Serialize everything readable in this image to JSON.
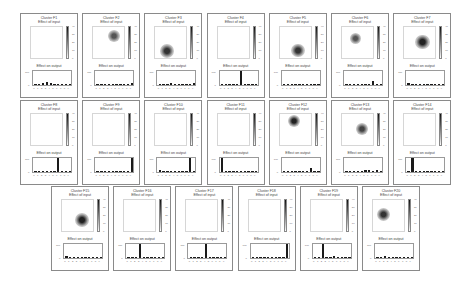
{
  "figure": {
    "panel_subtitle": "Effect of input",
    "output_title": "Effect on output",
    "colorbar_ticks": [
      "40",
      "30",
      "20",
      "10",
      "0"
    ],
    "bar_yticks": [
      "100",
      "0"
    ],
    "bar_xticks": [
      "0",
      "1",
      "2",
      "3",
      "4",
      "5",
      "6",
      "7",
      "8",
      "9"
    ]
  },
  "chart_data": {
    "type": "heatmap+bar",
    "ylim_bars": [
      0,
      100
    ],
    "panels": [
      {
        "title": "Cluster F1",
        "blob": null,
        "values": [
          10,
          10,
          12,
          20,
          12,
          2,
          0,
          0,
          0,
          0
        ]
      },
      {
        "title": "Cluster F2",
        "blob": {
          "x": 0.62,
          "y": 0.28,
          "r": 0.18,
          "c": "#555"
        },
        "values": [
          5,
          0,
          0,
          0,
          5,
          0,
          0,
          5,
          8,
          12
        ]
      },
      {
        "title": "Cluster F3",
        "blob": {
          "x": 0.35,
          "y": 0.72,
          "r": 0.22,
          "c": "#333"
        },
        "values": [
          10,
          0,
          0,
          12,
          0,
          5,
          0,
          0,
          0,
          12
        ]
      },
      {
        "title": "Cluster F4",
        "blob": null,
        "values": [
          2,
          2,
          6,
          0,
          0,
          100,
          0,
          0,
          0,
          0
        ]
      },
      {
        "title": "Cluster F5",
        "blob": {
          "x": 0.55,
          "y": 0.7,
          "r": 0.2,
          "c": "#333"
        },
        "values": [
          0,
          0,
          10,
          0,
          0,
          5,
          8,
          5,
          2,
          0
        ]
      },
      {
        "title": "Cluster F6",
        "blob": {
          "x": 0.4,
          "y": 0.35,
          "r": 0.17,
          "c": "#555"
        },
        "values": [
          0,
          0,
          0,
          0,
          5,
          5,
          8,
          30,
          2,
          10
        ]
      },
      {
        "title": "Cluster F7",
        "blob": {
          "x": 0.55,
          "y": 0.45,
          "r": 0.22,
          "c": "#222"
        },
        "values": [
          15,
          0,
          0,
          2,
          0,
          0,
          0,
          0,
          0,
          5
        ]
      },
      {
        "title": "Cluster F8",
        "blob": null,
        "values": [
          0,
          0,
          0,
          0,
          5,
          0,
          100,
          5,
          0,
          0
        ]
      },
      {
        "title": "Cluster F9",
        "blob": null,
        "values": [
          0,
          0,
          2,
          0,
          2,
          0,
          0,
          2,
          5,
          100
        ]
      },
      {
        "title": "Cluster F10",
        "blob": null,
        "values": [
          12,
          0,
          0,
          0,
          2,
          0,
          0,
          0,
          100,
          0
        ]
      },
      {
        "title": "Cluster F11",
        "blob": null,
        "values": [
          100,
          0,
          0,
          0,
          0,
          2,
          5,
          5,
          0,
          2
        ]
      },
      {
        "title": "Cluster F12",
        "blob": {
          "x": 0.42,
          "y": 0.22,
          "r": 0.18,
          "c": "#222"
        },
        "values": [
          2,
          2,
          2,
          0,
          0,
          0,
          0,
          30,
          0,
          5
        ]
      },
      {
        "title": "Cluster F13",
        "blob": {
          "x": 0.6,
          "y": 0.45,
          "r": 0.18,
          "c": "#444"
        },
        "values": [
          0,
          0,
          8,
          0,
          0,
          15,
          12,
          0,
          12,
          8
        ]
      },
      {
        "title": "Cluster F14",
        "blob": null,
        "values": [
          0,
          100,
          0,
          0,
          0,
          0,
          0,
          8,
          0,
          2
        ]
      },
      {
        "title": "Cluster F15",
        "blob": {
          "x": 0.6,
          "y": 0.6,
          "r": 0.22,
          "c": "#222"
        },
        "values": [
          12,
          0,
          0,
          0,
          0,
          0,
          0,
          10,
          0,
          5
        ]
      },
      {
        "title": "Cluster F16",
        "blob": null,
        "values": [
          0,
          0,
          0,
          100,
          0,
          0,
          5,
          5,
          5,
          0
        ]
      },
      {
        "title": "Cluster F17",
        "blob": null,
        "values": [
          0,
          0,
          0,
          0,
          100,
          5,
          2,
          2,
          0,
          0
        ]
      },
      {
        "title": "Cluster F18",
        "blob": null,
        "values": [
          0,
          2,
          0,
          0,
          5,
          0,
          0,
          0,
          8,
          100
        ]
      },
      {
        "title": "Cluster F19",
        "blob": null,
        "values": [
          0,
          0,
          100,
          8,
          0,
          15,
          0,
          0,
          5,
          5
        ]
      },
      {
        "title": "Cluster F20",
        "blob": {
          "x": 0.32,
          "y": 0.45,
          "r": 0.2,
          "c": "#333"
        },
        "values": [
          10,
          5,
          12,
          2,
          0,
          0,
          0,
          0,
          10,
          2
        ]
      }
    ]
  }
}
